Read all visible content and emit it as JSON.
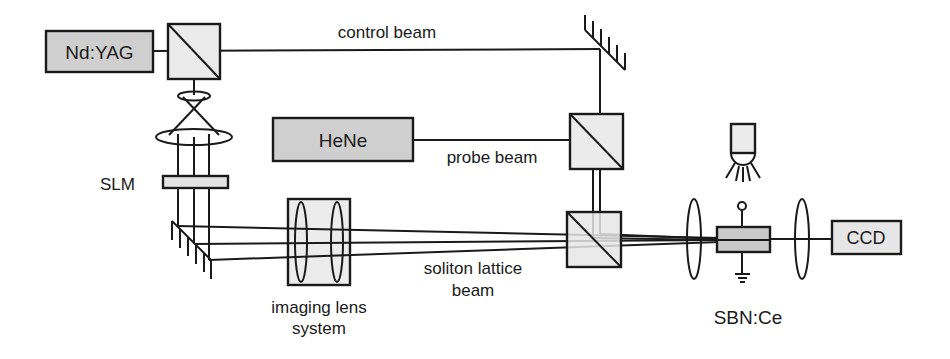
{
  "diagram": {
    "type": "optical-setup",
    "colors": {
      "line": "#1a1a1a",
      "component_fill": "#d0d0d0",
      "light_fill": "#e8e8e8",
      "background": "#ffffff"
    },
    "components": {
      "ndyag": {
        "label": "Nd:YAG"
      },
      "hene": {
        "label": "HeNe"
      },
      "ccd": {
        "label": "CCD"
      },
      "slm": {
        "label": "SLM"
      },
      "crystal": {
        "label": "SBN:Ce"
      },
      "imaging_lens": {
        "label_line1": "imaging lens",
        "label_line2": "system"
      }
    },
    "beams": {
      "control": {
        "label": "control beam"
      },
      "probe": {
        "label": "probe beam"
      },
      "lattice": {
        "label_line1": "soliton lattice",
        "label_line2": "beam"
      }
    }
  }
}
